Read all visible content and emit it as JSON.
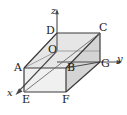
{
  "figure": {
    "kind": "3d-rectangular-box-coordinate-diagram",
    "background_color": "#ffffff",
    "stroke_color": "#3a3a3a",
    "label_color": "#1a1a1a",
    "face_colors": {
      "top": "#e4e4e4",
      "right": "#d0d0d0",
      "front": "#efefef",
      "hidden": "#f6f6f6"
    },
    "axes": [
      {
        "id": "x",
        "label": "x",
        "label_x": 7,
        "label_y": 88,
        "direction": "down-left"
      },
      {
        "id": "y",
        "label": "y",
        "label_x": 117,
        "label_y": 54,
        "direction": "right"
      },
      {
        "id": "z",
        "label": "z",
        "label_x": 51,
        "label_y": 6,
        "direction": "up"
      }
    ],
    "vertices": [
      {
        "id": "A",
        "label": "A",
        "label_x": 14,
        "label_y": 62
      },
      {
        "id": "B",
        "label": "B",
        "label_x": 67,
        "label_y": 62
      },
      {
        "id": "C",
        "label": "C",
        "label_x": 99,
        "label_y": 22
      },
      {
        "id": "D",
        "label": "D",
        "label_x": 46,
        "label_y": 25
      },
      {
        "id": "E",
        "label": "E",
        "label_x": 22,
        "label_y": 94
      },
      {
        "id": "F",
        "label": "F",
        "label_x": 62,
        "label_y": 94
      },
      {
        "id": "G",
        "label": "G",
        "label_x": 101,
        "label_y": 58
      },
      {
        "id": "O",
        "label": "O",
        "label_x": 48,
        "label_y": 44
      }
    ]
  }
}
